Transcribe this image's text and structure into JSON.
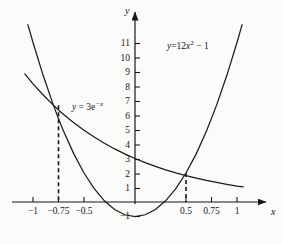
{
  "chart_data": {
    "type": "line",
    "title": "",
    "xlabel": "x",
    "ylabel": "y",
    "xlim": [
      -1.18,
      1.32
    ],
    "ylim": [
      -1.6,
      12.2
    ],
    "grid": false,
    "legend": "inline-curve-labels",
    "x_ticks": [
      {
        "value": -1,
        "label": "−1"
      },
      {
        "value": -0.75,
        "label": "−0.75"
      },
      {
        "value": -0.5,
        "label": "−0.5"
      },
      {
        "value": 0.5,
        "label": "0.5"
      },
      {
        "value": 0.75,
        "label": "0.75"
      },
      {
        "value": 1,
        "label": "1"
      }
    ],
    "y_ticks": [
      {
        "value": -1,
        "label": "−1"
      },
      {
        "value": 1,
        "label": "1"
      },
      {
        "value": 2,
        "label": "2"
      },
      {
        "value": 3,
        "label": "3"
      },
      {
        "value": 4,
        "label": "4"
      },
      {
        "value": 5,
        "label": "5"
      },
      {
        "value": 6,
        "label": "6"
      },
      {
        "value": 7,
        "label": "7"
      },
      {
        "value": 8,
        "label": "8"
      },
      {
        "value": 9,
        "label": "9"
      },
      {
        "value": 10,
        "label": "10"
      },
      {
        "value": 11,
        "label": "11"
      }
    ],
    "series": [
      {
        "name": "parabola",
        "equation": "y=12x² − 1",
        "label_parts": {
          "lhs": "y",
          "eq": "=12",
          "var": "x",
          "exp": "2",
          "rhs": " − 1"
        },
        "label_x": 0.33,
        "label_y": 10.4,
        "color": "#1b1b1b",
        "points_x": [
          -1.05,
          -1.0,
          -0.9,
          -0.8,
          -0.75,
          -0.7,
          -0.6,
          -0.5,
          -0.4,
          -0.3,
          -0.2,
          -0.1,
          0,
          0.1,
          0.2,
          0.3,
          0.4,
          0.5,
          0.6,
          0.7,
          0.8,
          0.9,
          1.0,
          1.05
        ],
        "points_y": [
          12.23,
          11.0,
          8.72,
          6.68,
          5.75,
          4.88,
          3.32,
          2.0,
          0.92,
          0.08,
          -0.52,
          -0.88,
          -1.0,
          -0.88,
          -0.52,
          0.08,
          0.92,
          2.0,
          3.32,
          4.88,
          6.68,
          8.72,
          11.0,
          12.23
        ]
      },
      {
        "name": "exponential",
        "equation": "y = 3e⁻ˣ",
        "label_parts": {
          "lhs": "y",
          "eq": " = 3",
          "base": "e",
          "exp": "−x"
        },
        "label_x": -0.41,
        "label_y": 6.45,
        "color": "#1b1b1b",
        "points_x": [
          -1.08,
          -1.0,
          -0.9,
          -0.8,
          -0.75,
          -0.7,
          -0.6,
          -0.5,
          -0.4,
          -0.3,
          -0.2,
          -0.1,
          0,
          0.1,
          0.2,
          0.3,
          0.4,
          0.5,
          0.6,
          0.7,
          0.8,
          0.9,
          1.0,
          1.06
        ],
        "points_y": [
          8.84,
          8.15,
          7.38,
          6.68,
          6.35,
          6.04,
          5.47,
          4.95,
          4.48,
          4.05,
          3.66,
          3.32,
          3.0,
          2.71,
          2.46,
          2.22,
          2.01,
          1.82,
          1.65,
          1.49,
          1.35,
          1.22,
          1.1,
          1.04
        ]
      }
    ],
    "intersections": [
      {
        "x": -0.75,
        "y": 6.68,
        "dashed_drop": true
      },
      {
        "x": 0.5,
        "y": 2.0,
        "dashed_drop": true
      }
    ]
  },
  "axes": {
    "x_axis_label": "x",
    "y_axis_label": "y"
  }
}
